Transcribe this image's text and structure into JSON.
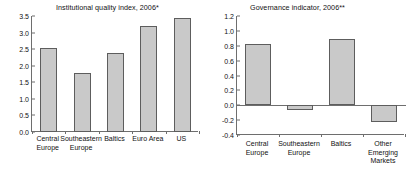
{
  "figure": {
    "background": "#ffffff",
    "bar_fill": "#c9c9c9",
    "bar_edge": "#5d5d5d",
    "axis_color": "#6e6e6e"
  },
  "chart_data": [
    {
      "type": "bar",
      "panel": "left",
      "title": "Institutional quality index, 2006*",
      "xlabel": "",
      "ylabel": "",
      "categories": [
        "Central\nEurope",
        "Southeastern\nEurope",
        "Baltics",
        "Euro Area",
        "US"
      ],
      "values": [
        2.52,
        1.78,
        2.38,
        3.2,
        3.43
      ],
      "ylim": [
        0.0,
        3.5
      ],
      "yticks": [
        "0.0",
        "0.5",
        "1.0",
        "1.5",
        "2.0",
        "2.5",
        "3.0",
        "3.5"
      ],
      "ytick_values": [
        0.0,
        0.5,
        1.0,
        1.5,
        2.0,
        2.5,
        3.0,
        3.5
      ],
      "grid": false,
      "legend": "none"
    },
    {
      "type": "bar",
      "panel": "right",
      "title": "Governance indicator, 2006**",
      "xlabel": "",
      "ylabel": "",
      "categories": [
        "Central\nEurope",
        "Southeastern\nEurope",
        "Baltics",
        "Other\nEmerging\nMarkets"
      ],
      "values": [
        0.82,
        -0.06,
        0.89,
        -0.22
      ],
      "ylim": [
        -0.4,
        1.2
      ],
      "yticks": [
        "-0.4",
        "-0.2",
        "0.0",
        "0.2",
        "0.4",
        "0.6",
        "0.8",
        "1.0",
        "1.2"
      ],
      "ytick_values": [
        -0.4,
        -0.2,
        0.0,
        0.2,
        0.4,
        0.6,
        0.8,
        1.0,
        1.2
      ],
      "grid": false,
      "legend": "none"
    }
  ]
}
